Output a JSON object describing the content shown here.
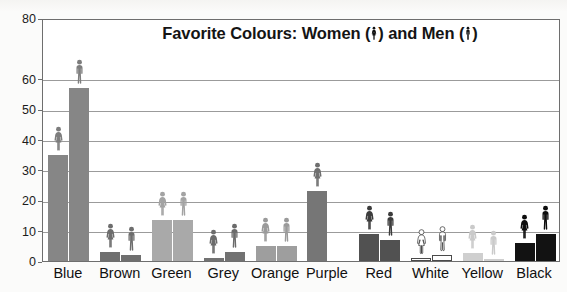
{
  "chart_data": {
    "type": "bar",
    "title_prefix": "Favorite Colours: Women (",
    "title_middle": ") and Men (",
    "title_suffix": ")",
    "xlabel": "",
    "ylabel": "Percentage",
    "ylim": [
      0,
      80
    ],
    "yticks": [
      0,
      10,
      20,
      30,
      40,
      50,
      60,
      80
    ],
    "ytick_labels": [
      "0",
      "10",
      "20",
      "30",
      "40",
      "50",
      "60",
      "80"
    ],
    "grid": true,
    "legend": "inline-in-title",
    "categories": [
      "Blue",
      "Brown",
      "Green",
      "Grey",
      "Orange",
      "Purple",
      "Red",
      "White",
      "Yellow",
      "Black"
    ],
    "series": [
      {
        "name": "Women",
        "icon": "female-figure-icon",
        "values": [
          35,
          3,
          13.5,
          1,
          5,
          23,
          9,
          1,
          2.5,
          6
        ]
      },
      {
        "name": "Men",
        "icon": "male-figure-icon",
        "values": [
          57,
          2,
          13.5,
          3,
          5,
          0,
          7,
          2,
          0.5,
          9
        ]
      }
    ],
    "bar_colors": {
      "Blue": "#868686",
      "Brown": "#6f6f6f",
      "Green": "#a9a9a9",
      "Grey": "#727272",
      "Orange": "#9e9e9e",
      "Purple": "#767676",
      "Red": "#515151",
      "White": "#ffffff",
      "Yellow": "#cfcfcf",
      "Black": "#121212"
    },
    "figure_colors": {
      "Blue": "#7d7d7d",
      "Brown": "#6d6d6d",
      "Green": "#a3a3a3",
      "Grey": "#6b6b6b",
      "Orange": "#9a9a9a",
      "Purple": "#6f6f6f",
      "Red": "#3c3c3c",
      "White": "#ffffff",
      "Yellow": "#cacaca",
      "Black": "#0d0d0d"
    }
  }
}
